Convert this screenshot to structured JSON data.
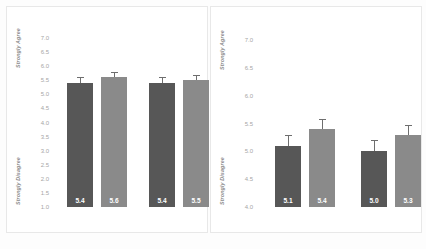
{
  "chart_data": [
    {
      "type": "bar",
      "panel": "left",
      "title": "",
      "xlabel": "",
      "ylabel": "",
      "ylim": [
        1.0,
        7.0
      ],
      "ytick_labels": [
        "7.0",
        "6.5",
        "6.0",
        "5.5",
        "5.0",
        "4.5",
        "4.0",
        "3.5",
        "3.0",
        "2.5",
        "2.0",
        "1.5",
        "1.0"
      ],
      "ytick_values": [
        7.0,
        6.5,
        6.0,
        5.5,
        5.0,
        4.5,
        4.0,
        3.5,
        3.0,
        2.5,
        2.0,
        1.5,
        1.0
      ],
      "axis_top_label": "Strongly Agree",
      "axis_bottom_label": "Strongly Disagree",
      "grid": false,
      "legend": "none",
      "groups": [
        {
          "bars": [
            {
              "label": "5.4",
              "value": 5.4,
              "error": 0.09,
              "color": "#575757",
              "shade": "dark"
            },
            {
              "label": "5.6",
              "value": 5.6,
              "error": 0.08,
              "color": "#8a8a8a",
              "shade": "light"
            }
          ]
        },
        {
          "bars": [
            {
              "label": "5.4",
              "value": 5.4,
              "error": 0.09,
              "color": "#575757",
              "shade": "dark"
            },
            {
              "label": "5.5",
              "value": 5.5,
              "error": 0.08,
              "color": "#8a8a8a",
              "shade": "light"
            }
          ]
        }
      ]
    },
    {
      "type": "bar",
      "panel": "right",
      "title": "",
      "xlabel": "",
      "ylabel": "",
      "ylim": [
        4.0,
        7.0
      ],
      "ytick_labels": [
        "7.0",
        "6.5",
        "6.0",
        "5.5",
        "5.0",
        "4.5",
        "4.0"
      ],
      "ytick_values": [
        7.0,
        6.5,
        6.0,
        5.5,
        5.0,
        4.5,
        4.0
      ],
      "axis_top_label": "Strongly Agree",
      "axis_bottom_label": "Strongly Disagree",
      "grid": false,
      "legend": "none",
      "groups": [
        {
          "bars": [
            {
              "label": "5.1",
              "value": 5.1,
              "error": 0.09,
              "color": "#575757",
              "shade": "dark"
            },
            {
              "label": "5.4",
              "value": 5.4,
              "error": 0.08,
              "color": "#8a8a8a",
              "shade": "light"
            }
          ]
        },
        {
          "bars": [
            {
              "label": "5.0",
              "value": 5.0,
              "error": 0.09,
              "color": "#575757",
              "shade": "dark"
            },
            {
              "label": "5.3",
              "value": 5.3,
              "error": 0.08,
              "color": "#8a8a8a",
              "shade": "light"
            }
          ]
        }
      ]
    }
  ],
  "colors": {
    "dark_bar": "#575757",
    "light_bar": "#8a8a8a",
    "tick_text": "#a6a6a6",
    "anchor_text": "#8d8d8d",
    "panel_border": "#e8e8e8",
    "background": "#ffffff"
  }
}
